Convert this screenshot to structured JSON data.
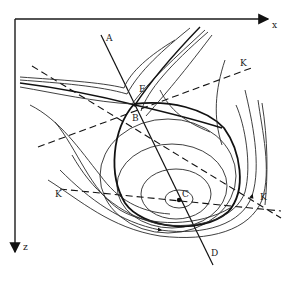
{
  "figure": {
    "type": "phase-portrait",
    "axes": {
      "x_label": "x",
      "z_label": "z"
    },
    "lines": {
      "AD": {
        "start_label": "A",
        "end_label": "D"
      },
      "KK_upper": {
        "start_label": "",
        "end_label": "K"
      },
      "KK_lower": {
        "start_label": "K",
        "end_label": "K"
      }
    },
    "points": {
      "E": {
        "label": "E"
      },
      "B": {
        "label": "B"
      },
      "C": {
        "label": "C"
      }
    },
    "colors": {
      "ink": "#1a1a1a",
      "background": "#ffffff"
    }
  }
}
